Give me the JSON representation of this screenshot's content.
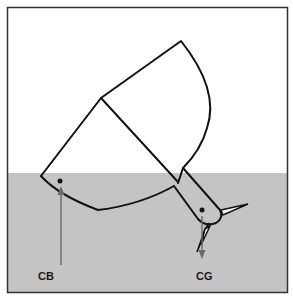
{
  "diagram": {
    "type": "stability-diagram",
    "colors": {
      "frame": "#333333",
      "water": "#c4c4c4",
      "air": "#ffffff",
      "outline": "#111111",
      "arrow": "#6a6a6a"
    },
    "labels": {
      "cb": "CB",
      "cg": "CG"
    },
    "points": {
      "cb_dot": [
        60,
        181
      ],
      "cg_dot": [
        202,
        210
      ]
    }
  }
}
